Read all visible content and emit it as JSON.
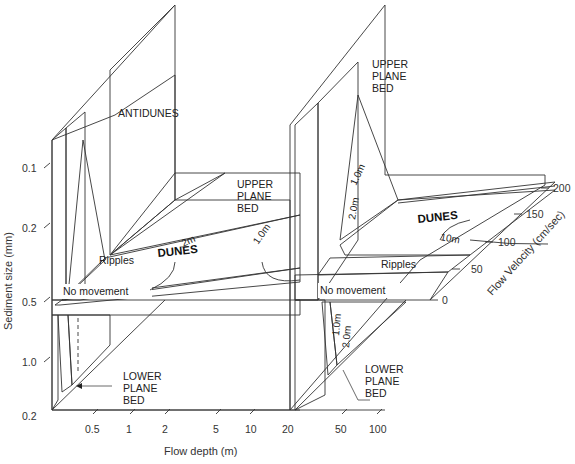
{
  "diagram": {
    "axes": {
      "sediment_size": {
        "label": "Sediment size (mm)",
        "ticks": [
          "0.1",
          "0.2",
          "0.5",
          "1.0",
          "0.2"
        ]
      },
      "flow_depth": {
        "label": "Flow depth (m)",
        "ticks": [
          "0.5",
          "1",
          "2",
          "5",
          "10",
          "20",
          "50",
          "100"
        ]
      },
      "flow_velocity": {
        "label": "Flow Velocity (cm/sec)",
        "ticks": [
          "0",
          "50",
          "100",
          "150",
          "200"
        ]
      }
    },
    "regions": {
      "antidunes": "ANTIDUNES",
      "upper_plane_bed_left": [
        "UPPER",
        "PLANE",
        "BED"
      ],
      "upper_plane_bed_right": [
        "UPPER",
        "PLANE",
        "BED"
      ],
      "dunes_left": "DUNES",
      "dunes_right": "DUNES",
      "ripples_left": "Ripples",
      "ripples_right": "Ripples",
      "no_movement_left": "No movement",
      "no_movement_right": "No movement",
      "lower_plane_bed_left": [
        "LOWER",
        "PLANE",
        "BED"
      ],
      "lower_plane_bed_right": [
        "LOWER",
        "PLANE",
        "BED"
      ]
    },
    "contours": {
      "left_floor": [
        ".2m",
        "1.0m"
      ],
      "right_wall": [
        "1.0m",
        "2.0m"
      ],
      "right_floor": [
        "10m"
      ],
      "right_lower": [
        "1.0m",
        "2.0m"
      ]
    },
    "colors": {
      "dunes_fill": "#bdbdbd",
      "stipple_fill": "#e6e6e6",
      "hatch_stroke": "#555555",
      "line": "#333333"
    }
  }
}
